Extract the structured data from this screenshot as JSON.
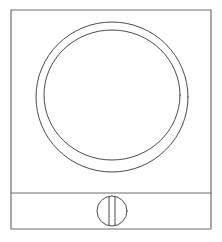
{
  "figure": {
    "description": "Technical line drawing of an appliance front: rectangular cabinet outline, large concentric circular door ring, lower horizontal panel divider, and a small slotted round knob centered on the lower panel.",
    "background_color": "#ffffff",
    "line_color": "#4a4a4a",
    "line_color_light": "#8a8a8a",
    "stroke_width": 1
  },
  "geometry": {
    "canvas": {
      "width": 222,
      "height": 242
    },
    "cabinet_outline": {
      "label": "cabinet-outline",
      "x": 11,
      "y": 10,
      "width": 200,
      "height": 219,
      "stroke": "#6f6f6f",
      "stroke_width": 1.2
    },
    "panel_divider": {
      "label": "panel-divider-line",
      "x1": 11,
      "y1": 193,
      "x2": 211,
      "y2": 193,
      "stroke": "#6f6f6f",
      "stroke_width": 1.2
    },
    "door_ring_outer": {
      "label": "door-ring-outer-circle",
      "cx": 112,
      "cy": 97,
      "rx": 76,
      "ry": 75,
      "stroke": "#4a4a4a",
      "stroke_width": 1
    },
    "door_ring_inner": {
      "label": "door-ring-inner-circle",
      "cx": 112,
      "cy": 95,
      "rx": 68,
      "ry": 65,
      "stroke": "#4a4a4a",
      "stroke_width": 1
    },
    "knob_circle": {
      "label": "knob-circle",
      "cx": 112,
      "cy": 211,
      "rx": 15,
      "ry": 15,
      "stroke": "#4a4a4a",
      "stroke_width": 1
    },
    "knob_slot_left": {
      "label": "knob-slot-left-line",
      "x1": 109,
      "y1": 197,
      "x2": 109,
      "y2": 225,
      "stroke": "#4a4a4a",
      "stroke_width": 1
    },
    "knob_slot_right": {
      "label": "knob-slot-right-line",
      "x1": 115,
      "y1": 197,
      "x2": 115,
      "y2": 225,
      "stroke": "#4a4a4a",
      "stroke_width": 1
    }
  },
  "parts": [
    {
      "name": "cabinet-outline",
      "label": "Cabinet outline"
    },
    {
      "name": "door-ring-outer-circle",
      "label": "Door ring outer circle"
    },
    {
      "name": "door-ring-inner-circle",
      "label": "Door ring inner circle"
    },
    {
      "name": "panel-divider-line",
      "label": "Lower panel divider"
    },
    {
      "name": "knob-circle",
      "label": "Slotted knob"
    },
    {
      "name": "knob-slot-left-line",
      "label": "Knob slot left edge"
    },
    {
      "name": "knob-slot-right-line",
      "label": "Knob slot right edge"
    }
  ]
}
